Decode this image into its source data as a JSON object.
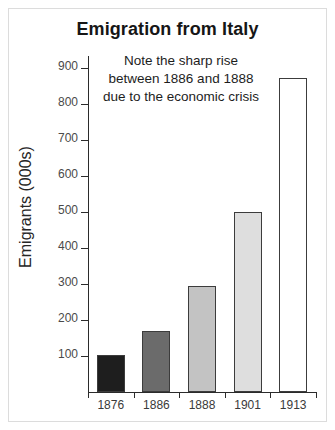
{
  "chart_data": {
    "type": "bar",
    "title": "Emigration from Italy",
    "xlabel": "",
    "ylabel": "Emigrants (000s)",
    "categories": [
      "1876",
      "1886",
      "1888",
      "1901",
      "1913"
    ],
    "values": [
      102,
      168,
      295,
      500,
      872
    ],
    "ylim": [
      0,
      930
    ],
    "yticks": [
      100,
      200,
      300,
      400,
      500,
      600,
      700,
      800,
      900
    ],
    "ytick_labels": [
      "100",
      "200",
      "300",
      "400",
      "500",
      "600",
      "700",
      "800",
      "900"
    ],
    "grid": false,
    "legend": "none",
    "bar_colors": [
      "#1e1e1e",
      "#6b6b6b",
      "#c3c3c3",
      "#dedede",
      "#ffffff"
    ],
    "bar_edge_color": "#3c3c3c",
    "annotations": [
      {
        "name": "sharp-rise-note",
        "lines": [
          "Note the sharp rise",
          "between 1886 and 1888",
          "due to the economic crisis"
        ]
      }
    ]
  },
  "figure": {
    "background": "#ffffff",
    "frame_color": "#dcdcdc",
    "axis_color": "#2b2b2b",
    "title_color": "#161616",
    "tick_label_color": "#4a4a4a"
  }
}
